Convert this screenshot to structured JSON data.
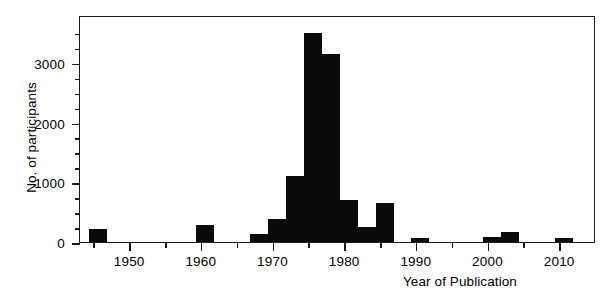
{
  "chart_data": {
    "type": "bar",
    "title": "",
    "xlabel": "Year of Publication",
    "ylabel": "No. of participants",
    "xlim": [
      1943,
      2015
    ],
    "ylim": [
      0,
      3800
    ],
    "grid": false,
    "legend_position": "none",
    "bar_width_years": 2.5,
    "x_major_ticks": [
      1950,
      1960,
      1970,
      1980,
      1990,
      2000,
      2010
    ],
    "x_minor_ticks": [
      1945,
      1955,
      1965,
      1975,
      1985,
      1995,
      2005
    ],
    "y_major_ticks": [
      0,
      1000,
      2000,
      3000
    ],
    "y_minor_ticks": [
      250,
      500,
      750,
      1250,
      1500,
      1750,
      2250,
      2500,
      2750,
      3250,
      3500
    ],
    "x_tick_labels": [
      "1950",
      "1960",
      "1970",
      "1980",
      "1990",
      "2000",
      "2010"
    ],
    "y_tick_labels": [
      "0",
      "1000",
      "2000",
      "3000"
    ],
    "bar_color": "#0a0a0a",
    "x": [
      1945.5,
      1960.5,
      1968.0,
      1970.5,
      1973.0,
      1975.5,
      1978.0,
      1980.5,
      1983.0,
      1985.5,
      1990.5,
      2000.5,
      2003.0,
      2010.5
    ],
    "values": [
      220,
      290,
      130,
      380,
      1100,
      3500,
      3150,
      700,
      250,
      650,
      70,
      90,
      160,
      60
    ],
    "annotations": [
      {
        "id": "ritzel-rct",
        "lines": [
          "Ritzel",
          "RCT"
        ],
        "arrow_year": 1960.5,
        "align": "center"
      },
      {
        "id": "pauling-book",
        "lines": [
          "Pauling",
          "book"
        ],
        "arrow_year": 1970.5,
        "align": "center"
      },
      {
        "id": "chalmers-dykes-karlowski",
        "lines": [
          "Chalmers review",
          "Dykes and Meier review",
          "Karlowski RCT"
        ],
        "arrow_year": 1975.5,
        "align": "left"
      }
    ]
  }
}
